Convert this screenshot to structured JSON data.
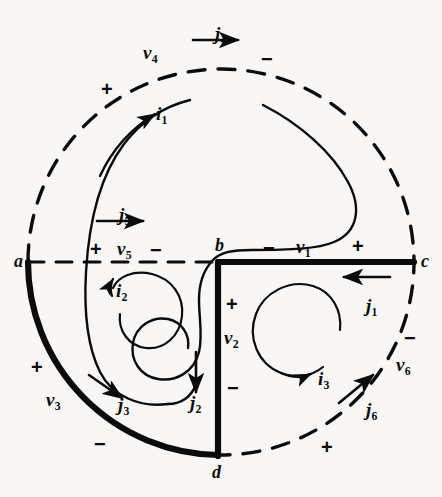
{
  "figure": {
    "background_color": "#f8f7f5",
    "ink_color": "#0b0b0b"
  },
  "nodes": [
    {
      "id": "a",
      "label": "a",
      "x": 14,
      "y": 252
    },
    {
      "id": "b",
      "label": "b",
      "x": 215,
      "y": 236
    },
    {
      "id": "c",
      "label": "c",
      "x": 421,
      "y": 252
    },
    {
      "id": "d",
      "label": "d",
      "x": 212,
      "y": 463
    }
  ],
  "voltages": [
    {
      "id": "v1",
      "label": "v",
      "sub": "1",
      "x": 296,
      "y": 237,
      "plus": {
        "x": 352,
        "y": 236
      },
      "minus": {
        "x": 263,
        "y": 238
      }
    },
    {
      "id": "v2",
      "label": "v",
      "sub": "2",
      "x": 224,
      "y": 328,
      "plus": {
        "x": 226,
        "y": 294
      },
      "minus": {
        "x": 227,
        "y": 378
      }
    },
    {
      "id": "v3",
      "label": "v",
      "sub": "3",
      "x": 46,
      "y": 390,
      "plus": {
        "x": 31,
        "y": 357
      },
      "minus": {
        "x": 94,
        "y": 434
      }
    },
    {
      "id": "v4",
      "label": "v",
      "sub": "4",
      "x": 143,
      "y": 43,
      "plus": {
        "x": 101,
        "y": 79
      },
      "minus": {
        "x": 261,
        "y": 49
      }
    },
    {
      "id": "v5",
      "label": "v",
      "sub": "5",
      "x": 117,
      "y": 239,
      "plus": {
        "x": 90,
        "y": 239
      },
      "minus": {
        "x": 150,
        "y": 240
      }
    },
    {
      "id": "v6",
      "label": "v",
      "sub": "6",
      "x": 396,
      "y": 355,
      "plus": {
        "x": 321,
        "y": 437
      },
      "minus": {
        "x": 404,
        "y": 328
      }
    }
  ],
  "branch_currents": [
    {
      "id": "j1",
      "label": "j",
      "sub": "1",
      "x": 366,
      "y": 296,
      "direction": "left"
    },
    {
      "id": "j2",
      "label": "j",
      "sub": "2",
      "x": 190,
      "y": 393,
      "direction": "down"
    },
    {
      "id": "j3",
      "label": "j",
      "sub": "3",
      "x": 118,
      "y": 395,
      "direction": "down-right"
    },
    {
      "id": "j4",
      "label": "j",
      "sub": "4",
      "x": 215,
      "y": 24,
      "direction": "right"
    },
    {
      "id": "j5",
      "label": "j",
      "sub": "5",
      "x": 119,
      "y": 205,
      "direction": "right"
    },
    {
      "id": "j6",
      "label": "j",
      "sub": "6",
      "x": 366,
      "y": 400,
      "direction": "up-right"
    }
  ],
  "loop_currents": [
    {
      "id": "i1",
      "label": "i",
      "sub": "1",
      "x": 156,
      "y": 104,
      "sense": "counterclockwise"
    },
    {
      "id": "i2",
      "label": "i",
      "sub": "2",
      "x": 116,
      "y": 281,
      "sense": "counterclockwise"
    },
    {
      "id": "i3",
      "label": "i",
      "sub": "3",
      "x": 318,
      "y": 369,
      "sense": "clockwise"
    }
  ]
}
